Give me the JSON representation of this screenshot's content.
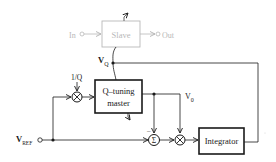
{
  "diagram": {
    "type": "block-diagram",
    "colors": {
      "main": "#1a1a1a",
      "faded": "#b8b8b8",
      "background": "#ffffff"
    },
    "slave": {
      "label": "Slave",
      "input_label": "In",
      "output_label": "Out"
    },
    "master": {
      "label_line1": "Q–tuning",
      "label_line2": "master"
    },
    "integrator": {
      "label": "Integrator"
    },
    "signals": {
      "vq": "V",
      "vq_sub": "Q",
      "v0": "V",
      "v0_sub": "0",
      "vref": "V",
      "vref_sub": "REF",
      "inv_q": "1/Q",
      "minus_sign": "–"
    },
    "operators": {
      "multiplier_symbol": "×",
      "summer_symbol": "Σ"
    }
  }
}
